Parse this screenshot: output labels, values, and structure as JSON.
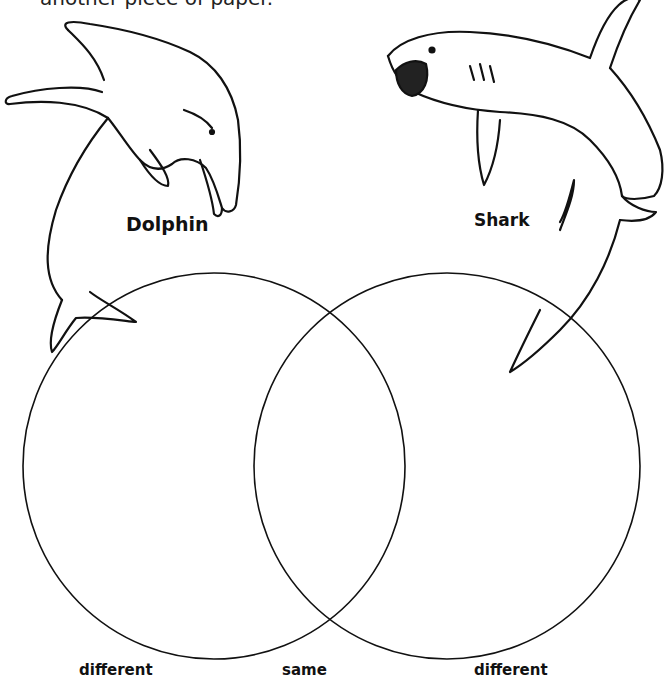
{
  "header": {
    "partial_instruction": "another piece of paper."
  },
  "labels": {
    "left_animal": "Dolphin",
    "right_animal": "Shark",
    "left_region": "different",
    "middle_region": "same",
    "right_region": "different"
  },
  "illustrations": {
    "left": "dolphin-illustration",
    "right": "shark-illustration"
  }
}
